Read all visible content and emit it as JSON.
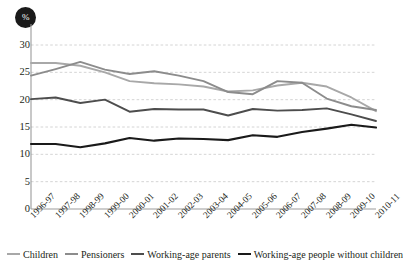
{
  "chart_data": {
    "type": "line",
    "title": "",
    "subtitle": "",
    "xlabel": "",
    "ylabel": "%",
    "unit_badge": "%",
    "grid": true,
    "grid_axis": "y",
    "legend_position": "bottom",
    "ylim": [
      0,
      30
    ],
    "yticks": [
      0,
      5,
      10,
      15,
      20,
      25,
      30
    ],
    "ytick_labels": [
      "0",
      "5",
      "10",
      "15",
      "20",
      "25",
      "30"
    ],
    "categories": [
      "1996-97",
      "1997-98",
      "1998-99",
      "1999-00",
      "2000-01",
      "2001-02",
      "2002-03",
      "2003-04",
      "2004-05",
      "2005-06",
      "2006-07",
      "2007-08",
      "2008-09",
      "2009-10",
      "2010-11"
    ],
    "series": [
      {
        "name": "Children",
        "color": "#a8a8a8",
        "values": [
          26.7,
          26.7,
          26.2,
          25.0,
          23.4,
          23.0,
          22.8,
          22.4,
          21.5,
          21.7,
          22.6,
          23.1,
          22.4,
          20.4,
          17.9
        ]
      },
      {
        "name": "Pensioners",
        "color": "#8c8c8c",
        "values": [
          24.4,
          25.6,
          26.9,
          25.5,
          24.7,
          25.2,
          24.4,
          23.4,
          21.4,
          21.0,
          23.4,
          23.1,
          20.2,
          18.8,
          18.1
        ]
      },
      {
        "name": "Working-age parents",
        "color": "#4d4d4d",
        "values": [
          20.1,
          20.4,
          19.4,
          20.0,
          17.8,
          18.3,
          18.2,
          18.2,
          17.1,
          18.3,
          18.0,
          18.1,
          18.4,
          17.3,
          16.1
        ]
      },
      {
        "name": "Working-age people without children",
        "color": "#1a1a1a",
        "values": [
          11.9,
          11.9,
          11.3,
          12.0,
          13.0,
          12.5,
          12.9,
          12.8,
          12.6,
          13.5,
          13.2,
          14.1,
          14.7,
          15.4,
          14.9
        ]
      }
    ]
  },
  "axis": {
    "badge_label": "%",
    "ytick_labels": [
      "30",
      "25",
      "20",
      "15",
      "10",
      "5",
      "0"
    ],
    "xtick_labels": [
      "1996-97",
      "1997-98",
      "1998-99",
      "1999-00",
      "2000-01",
      "2001-02",
      "2002-03",
      "2003-04",
      "2004-05",
      "2005-06",
      "2006-07",
      "2007-08",
      "2008-09",
      "2009-10",
      "2010-11"
    ]
  },
  "legend": {
    "items": [
      {
        "label": "Children",
        "color": "#a8a8a8"
      },
      {
        "label": "Pensioners",
        "color": "#8c8c8c"
      },
      {
        "label": "Working-age parents",
        "color": "#4d4d4d"
      },
      {
        "label": "Working-age people without children",
        "color": "#1a1a1a"
      }
    ]
  },
  "colors": {
    "axis": "#9b9b9b",
    "grid": "#c9c9c9",
    "text": "#231f20",
    "badge_bg": "#1a1a1a",
    "badge_fg": "#ffffff",
    "background": "#ffffff"
  }
}
